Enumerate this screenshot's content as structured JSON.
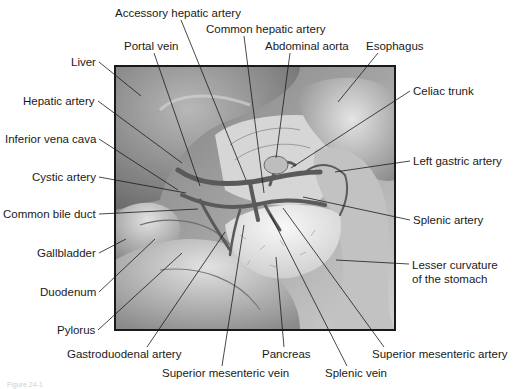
{
  "diagram": {
    "type": "anatomical-illustration",
    "frame": {
      "x": 115,
      "y": 66,
      "width": 280,
      "height": 264,
      "border_color": "#1a1a1a"
    },
    "colors": {
      "background": "#ffffff",
      "text": "#1a1a1a",
      "leader": "#1a1a1a",
      "tissue_dark": "#6e6e6e",
      "tissue_mid": "#a8a8a8",
      "tissue_light": "#e6e6e6",
      "vessel": "#5a5a5a"
    },
    "labels": [
      {
        "id": "accessory-hepatic-artery",
        "text": "Accessory hepatic artery",
        "x": 115,
        "y": 13,
        "anchor": "start",
        "point": [
          246,
          180
        ]
      },
      {
        "id": "common-hepatic-artery",
        "text": "Common hepatic artery",
        "x": 206,
        "y": 29,
        "anchor": "start",
        "point": [
          264,
          193
        ]
      },
      {
        "id": "portal-vein",
        "text": "Portal vein",
        "x": 124,
        "y": 46,
        "anchor": "start",
        "point": [
          200,
          186
        ]
      },
      {
        "id": "abdominal-aorta",
        "text": "Abdominal aorta",
        "x": 265,
        "y": 46,
        "anchor": "start",
        "point": [
          276,
          158
        ]
      },
      {
        "id": "esophagus",
        "text": "Esophagus",
        "x": 366,
        "y": 46,
        "anchor": "start",
        "point": [
          338,
          102
        ]
      },
      {
        "id": "liver",
        "text": "Liver",
        "x": 96,
        "y": 62,
        "anchor": "end",
        "point": [
          141,
          96
        ]
      },
      {
        "id": "celiac-trunk",
        "text": "Celiac trunk",
        "x": 413,
        "y": 91,
        "anchor": "start",
        "point": [
          291,
          168
        ]
      },
      {
        "id": "hepatic-artery",
        "text": "Hepatic artery",
        "x": 95,
        "y": 101,
        "anchor": "end",
        "point": [
          182,
          163
        ]
      },
      {
        "id": "inferior-vena-cava",
        "text": "Inferior vena cava",
        "x": 96,
        "y": 139,
        "anchor": "end",
        "point": [
          178,
          190
        ]
      },
      {
        "id": "left-gastric-artery",
        "text": "Left gastric artery",
        "x": 413,
        "y": 161,
        "anchor": "start",
        "point": [
          335,
          172
        ]
      },
      {
        "id": "cystic-artery",
        "text": "Cystic artery",
        "x": 96,
        "y": 177,
        "anchor": "end",
        "point": [
          186,
          193
        ]
      },
      {
        "id": "common-bile-duct",
        "text": "Common bile duct",
        "x": 96,
        "y": 214,
        "anchor": "end",
        "point": [
          198,
          209
        ]
      },
      {
        "id": "splenic-artery",
        "text": "Splenic artery",
        "x": 413,
        "y": 220,
        "anchor": "start",
        "point": [
          303,
          197
        ]
      },
      {
        "id": "gallbladder",
        "text": "Gallbladder",
        "x": 96,
        "y": 253,
        "anchor": "end",
        "point": [
          126,
          239
        ]
      },
      {
        "id": "lesser-curvature-of-the-stomach",
        "text": "Lesser curvature\nof the stomach",
        "x": 412,
        "y": 264,
        "anchor": "start",
        "point": [
          336,
          260
        ]
      },
      {
        "id": "duodenum",
        "text": "Duodenum",
        "x": 96,
        "y": 292,
        "anchor": "end",
        "point": [
          155,
          239
        ]
      },
      {
        "id": "pylorus",
        "text": "Pylorus",
        "x": 95,
        "y": 330,
        "anchor": "end",
        "point": [
          182,
          253
        ]
      },
      {
        "id": "superior-mesenteric-artery",
        "text": "Superior mesenteric artery",
        "x": 372,
        "y": 354,
        "anchor": "start",
        "point": [
          283,
          208
        ]
      },
      {
        "id": "gastroduodenal-artery",
        "text": "Gastroduodenal artery",
        "x": 67,
        "y": 354,
        "anchor": "start",
        "point": [
          225,
          232
        ]
      },
      {
        "id": "pancreas",
        "text": "Pancreas",
        "x": 262,
        "y": 354,
        "anchor": "start",
        "point": [
          276,
          257
        ]
      },
      {
        "id": "superior-mesenteric-vein",
        "text": "Superior mesenteric vein",
        "x": 162,
        "y": 373,
        "anchor": "start",
        "point": [
          244,
          225
        ]
      },
      {
        "id": "splenic-vein",
        "text": "Splenic vein",
        "x": 325,
        "y": 373,
        "anchor": "start",
        "point": [
          270,
          214
        ]
      }
    ]
  },
  "caption": "Figure 24-1"
}
